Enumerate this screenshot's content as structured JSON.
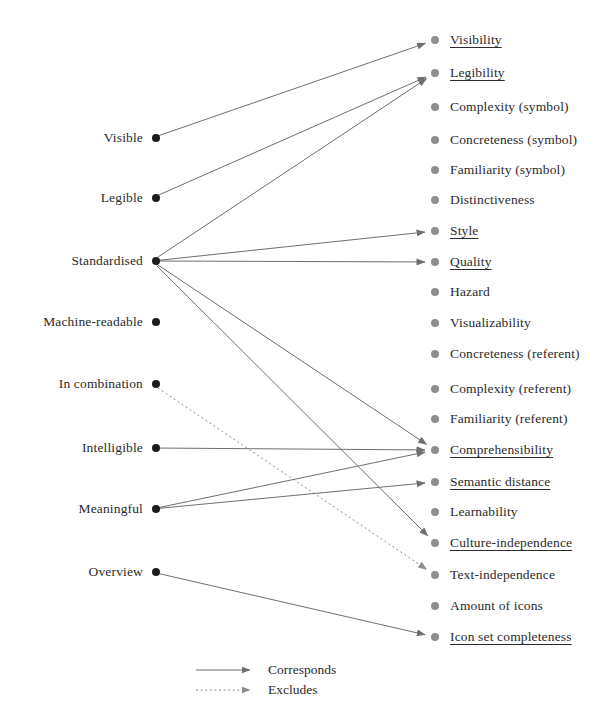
{
  "diagram": {
    "colors": {
      "left_dot": "#1c1c1c",
      "right_dot": "#8e8e8e",
      "edge": "#6f6f6f",
      "text": "#2b2b2b",
      "background": "#ffffff"
    },
    "left_column": {
      "name": "requirements",
      "dot_x": 152,
      "items": [
        {
          "id": "visible",
          "label": "Visible",
          "y": 138
        },
        {
          "id": "legible",
          "label": "Legible",
          "y": 198
        },
        {
          "id": "standardised",
          "label": "Standardised",
          "y": 261
        },
        {
          "id": "machine-readable",
          "label": "Machine-readable",
          "y": 322
        },
        {
          "id": "in-combination",
          "label": "In combination",
          "y": 384
        },
        {
          "id": "intelligible",
          "label": "Intelligible",
          "y": 448
        },
        {
          "id": "meaningful",
          "label": "Meaningful",
          "y": 509
        },
        {
          "id": "overview",
          "label": "Overview",
          "y": 572
        }
      ]
    },
    "right_column": {
      "name": "criteria",
      "dot_x": 435,
      "items": [
        {
          "id": "visibility",
          "label": "Visibility",
          "y": 40,
          "underlined": true
        },
        {
          "id": "legibility",
          "label": "Legibility",
          "y": 73,
          "underlined": true
        },
        {
          "id": "complexity-symbol",
          "label": "Complexity (symbol)",
          "y": 107,
          "underlined": false
        },
        {
          "id": "concreteness-symbol",
          "label": "Concreteness (symbol)",
          "y": 140,
          "underlined": false
        },
        {
          "id": "familiarity-symbol",
          "label": "Familiarity (symbol)",
          "y": 170,
          "underlined": false
        },
        {
          "id": "distinctiveness",
          "label": "Distinctiveness",
          "y": 200,
          "underlined": false
        },
        {
          "id": "style",
          "label": "Style",
          "y": 231,
          "underlined": true
        },
        {
          "id": "quality",
          "label": "Quality",
          "y": 262,
          "underlined": true
        },
        {
          "id": "hazard",
          "label": "Hazard",
          "y": 292,
          "underlined": false
        },
        {
          "id": "visualizability",
          "label": "Visualizability",
          "y": 323,
          "underlined": false
        },
        {
          "id": "concreteness-referent",
          "label": "Concreteness (referent)",
          "y": 354,
          "underlined": false
        },
        {
          "id": "complexity-referent",
          "label": "Complexity (referent)",
          "y": 389,
          "underlined": false
        },
        {
          "id": "familiarity-referent",
          "label": "Familiarity (referent)",
          "y": 419,
          "underlined": false
        },
        {
          "id": "comprehensibility",
          "label": "Comprehensibility",
          "y": 450,
          "underlined": true
        },
        {
          "id": "semantic-distance",
          "label": "Semantic distance",
          "y": 482,
          "underlined": true
        },
        {
          "id": "learnability",
          "label": "Learnability",
          "y": 512,
          "underlined": false
        },
        {
          "id": "culture-independence",
          "label": "Culture-independence",
          "y": 543,
          "underlined": true
        },
        {
          "id": "text-independence",
          "label": "Text-independence",
          "y": 575,
          "underlined": false
        },
        {
          "id": "amount-of-icons",
          "label": "Amount of icons",
          "y": 606,
          "underlined": false
        },
        {
          "id": "icon-set-completeness",
          "label": "Icon set completeness",
          "y": 637,
          "underlined": true
        }
      ]
    },
    "edges": [
      {
        "from": "visible",
        "to": "visibility",
        "type": "corresponds"
      },
      {
        "from": "legible",
        "to": "legibility",
        "type": "corresponds"
      },
      {
        "from": "standardised",
        "to": "legibility",
        "type": "corresponds"
      },
      {
        "from": "standardised",
        "to": "style",
        "type": "corresponds"
      },
      {
        "from": "standardised",
        "to": "quality",
        "type": "corresponds"
      },
      {
        "from": "standardised",
        "to": "comprehensibility",
        "type": "corresponds"
      },
      {
        "from": "standardised",
        "to": "culture-independence",
        "type": "corresponds"
      },
      {
        "from": "in-combination",
        "to": "text-independence",
        "type": "excludes"
      },
      {
        "from": "intelligible",
        "to": "comprehensibility",
        "type": "corresponds"
      },
      {
        "from": "meaningful",
        "to": "comprehensibility",
        "type": "corresponds"
      },
      {
        "from": "meaningful",
        "to": "semantic-distance",
        "type": "corresponds"
      },
      {
        "from": "overview",
        "to": "icon-set-completeness",
        "type": "corresponds"
      }
    ],
    "legend": {
      "items": [
        {
          "id": "corresponds",
          "label": "Corresponds",
          "style": "solid",
          "y": 670
        },
        {
          "id": "excludes",
          "label": "Excludes",
          "style": "dotted",
          "y": 690
        }
      ]
    }
  }
}
